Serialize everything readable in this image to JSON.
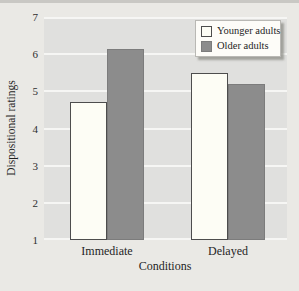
{
  "chart_data": {
    "type": "bar",
    "categories": [
      "Immediate",
      "Delayed"
    ],
    "series": [
      {
        "name": "Younger adults",
        "values": [
          4.7,
          5.5
        ],
        "fill": "#fdfdf5",
        "border": "#4d4d4d"
      },
      {
        "name": "Older adults",
        "values": [
          6.15,
          5.2
        ],
        "fill": "#8c8c8c",
        "border": "#7c7c7c"
      }
    ],
    "title": "",
    "xlabel": "Conditions",
    "ylabel": "Dispositional ratings",
    "ylim": [
      1,
      7
    ],
    "yticks": [
      1,
      2,
      3,
      4,
      5,
      6,
      7
    ],
    "grid": true,
    "legend_position": "top-right"
  },
  "colors": {
    "page_bg": "#eae9e5",
    "plot_bg": "#e0e0de",
    "grid_line": "#f6f6f4",
    "top_strip": "#c9c8c4",
    "legend_bg": "#fdfcf8",
    "legend_border": "#b9b8b4",
    "text": "#1f1f1f"
  }
}
